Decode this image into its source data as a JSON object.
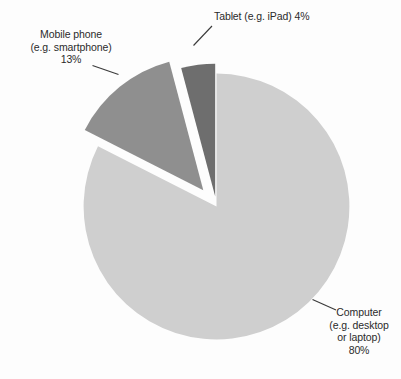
{
  "chart_data": {
    "type": "pie",
    "title": "",
    "subtitle": "",
    "xlabel": "",
    "ylabel": "",
    "legend_position": "labels-with-leader-lines",
    "grid": false,
    "exploded": true,
    "categories": [
      "Computer (e.g. desktop or laptop)",
      "Mobile phone (e.g. smartphone)",
      "Tablet (e.g. iPad)"
    ],
    "values": [
      80,
      13,
      4
    ],
    "units": "%",
    "slices": [
      {
        "key": "computer",
        "name": "Computer (e.g. desktop or laptop)",
        "value": 80,
        "value_label": "80%",
        "color": "#cfcfcf",
        "label_lines": [
          "Computer",
          "(e.g. desktop",
          "or laptop)",
          "80%"
        ]
      },
      {
        "key": "mobile",
        "name": "Mobile phone (e.g. smartphone)",
        "value": 13,
        "value_label": "13%",
        "color": "#8f8f8f",
        "label_lines": [
          "Mobile phone",
          "(e.g. smartphone)",
          "13%"
        ]
      },
      {
        "key": "tablet",
        "name": "Tablet (e.g. iPad)",
        "value": 4,
        "value_label": "4%",
        "color": "#6e6e6e",
        "label_lines": [
          "Tablet (e.g. iPad) 4%"
        ]
      }
    ]
  },
  "labels": {
    "tablet": {
      "line1": "Tablet (e.g. iPad) 4%"
    },
    "mobile": {
      "line1": "Mobile phone",
      "line2": "(e.g. smartphone)",
      "line3": "13%"
    },
    "computer": {
      "line1": "Computer",
      "line2": "(e.g. desktop",
      "line3": "or laptop)",
      "line4": "80%"
    }
  },
  "colors": {
    "background": "#fdfdfd",
    "text": "#2b2b2b",
    "leader_line": "#3a3a3a",
    "slice_computer": "#cfcfcf",
    "slice_mobile": "#8f8f8f",
    "slice_tablet": "#6e6e6e"
  }
}
